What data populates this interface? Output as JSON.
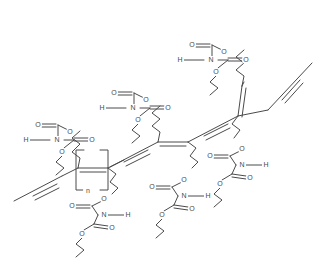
{
  "figure": {
    "kind": "chemical-structure-diagram",
    "background_color": "#ffffff",
    "line_color": "#4a4a4a",
    "bond_color_light": "#8c8c8c",
    "label_color": "#4a4a4a"
  },
  "repeat_unit": {
    "bracket_label": "n"
  },
  "atom_labels": {
    "oxygen": "O",
    "nitrogen": "N",
    "hydrogen": "H"
  },
  "backbone": {
    "type": "ene-yne polydiacetylene",
    "segments": [
      {
        "name": "terminal-alkyne-left",
        "bond": "triple"
      },
      {
        "name": "alkene-left",
        "bond": "double"
      },
      {
        "name": "alkyne-mid-left",
        "bond": "triple"
      },
      {
        "name": "alkene-center",
        "bond": "double"
      },
      {
        "name": "alkyne-mid-right",
        "bond": "triple"
      },
      {
        "name": "alkene-right",
        "bond": "double"
      },
      {
        "name": "terminal-alkyne-right",
        "bond": "triple"
      }
    ]
  },
  "side_groups": [
    {
      "id": "sg-upper-left",
      "labels": [
        "O",
        "H",
        "N",
        "O",
        "O"
      ]
    },
    {
      "id": "sg-upper-center",
      "labels": [
        "O",
        "H",
        "N",
        "O",
        "O"
      ]
    },
    {
      "id": "sg-upper-right",
      "labels": [
        "O",
        "H",
        "N",
        "O",
        "O"
      ]
    },
    {
      "id": "sg-lower-left",
      "labels": [
        "O",
        "N",
        "H",
        "O",
        "O"
      ]
    },
    {
      "id": "sg-lower-center",
      "labels": [
        "O",
        "N",
        "H",
        "O",
        "O"
      ]
    },
    {
      "id": "sg-lower-right",
      "labels": [
        "O",
        "N",
        "H",
        "O",
        "O"
      ]
    }
  ]
}
